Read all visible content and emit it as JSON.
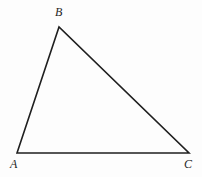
{
  "figure": {
    "type": "geometry-diagram",
    "shape": "triangle",
    "background_color": "#fdfdfd",
    "stroke_color": "#1f1f1f",
    "stroke_width": 1.6,
    "label_color": "#262626",
    "canvas": {
      "width": 202,
      "height": 177
    }
  },
  "labels": {
    "a": "A",
    "b": "B",
    "c": "C"
  },
  "geometry": {
    "vertices": [
      {
        "name": "A",
        "x": 17,
        "y": 153
      },
      {
        "name": "B",
        "x": 59,
        "y": 27
      },
      {
        "name": "C",
        "x": 189,
        "y": 153
      }
    ],
    "edges": [
      {
        "name": "AB",
        "from": "A",
        "to": "B"
      },
      {
        "name": "BC",
        "from": "B",
        "to": "C"
      },
      {
        "name": "CA",
        "from": "C",
        "to": "A"
      }
    ],
    "polygon_points": "17,153 59,27 189,153",
    "label_positions": {
      "A": {
        "x": 10,
        "y": 158
      },
      "B": {
        "x": 55,
        "y": 6
      },
      "C": {
        "x": 184,
        "y": 158
      }
    }
  }
}
